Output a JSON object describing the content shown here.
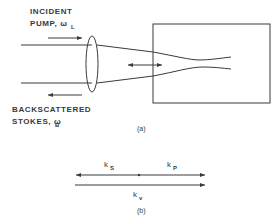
{
  "part_a": {
    "pump_label_line1": "INCIDENT",
    "pump_label_line2": "PUMP, ω",
    "pump_subscript": "L",
    "stokes_label_line1": "BACKSCATTERED",
    "stokes_label_line2": "STOKES, ω",
    "stokes_subscript": "B",
    "caption": "(a)"
  },
  "part_b": {
    "ks_label": "k",
    "ks_subscript": "S",
    "kp_label": "k",
    "kp_subscript": "P",
    "kv_label": "k",
    "kv_subscript": "v",
    "caption": "(b)"
  },
  "colors": {
    "line": "#3a3a3a",
    "background": "#ffffff"
  }
}
